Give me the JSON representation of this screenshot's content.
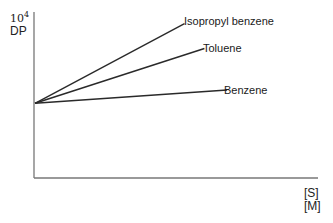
{
  "chart_data": {
    "type": "line",
    "title": "",
    "xlabel": "[S]/[M]",
    "xlabel_numerator": "[S]",
    "xlabel_denominator": "[M]",
    "ylabel": "10^4 DP",
    "ylabel_scale": "10",
    "ylabel_scale_exp": "4",
    "ylabel_text": "DP",
    "grid": false,
    "legend": "inline labels at line ends",
    "x_ticks": [],
    "y_ticks": [],
    "note": "Schematic plot without numeric ticks; lines share a common y-intercept and differ in slope.",
    "series": [
      {
        "name": "Isopropyl benzene",
        "x": [
          0,
          0.53
        ],
        "y": [
          0.45,
          0.93
        ],
        "slope_rank": 1
      },
      {
        "name": "Toluene",
        "x": [
          0,
          0.6
        ],
        "y": [
          0.45,
          0.78
        ],
        "slope_rank": 2
      },
      {
        "name": "Benzene",
        "x": [
          0,
          0.68
        ],
        "y": [
          0.45,
          0.53
        ],
        "slope_rank": 3
      }
    ],
    "xlim": [
      0,
      1
    ],
    "ylim": [
      0,
      1
    ]
  },
  "plot": {
    "origin_px": [
      34,
      178
    ],
    "x_axis_end_px": 318,
    "y_axis_top_px": 12,
    "intercept_px": [
      35,
      157
    ],
    "line_color": "#2a2a2a",
    "axis_color": "#777777"
  }
}
